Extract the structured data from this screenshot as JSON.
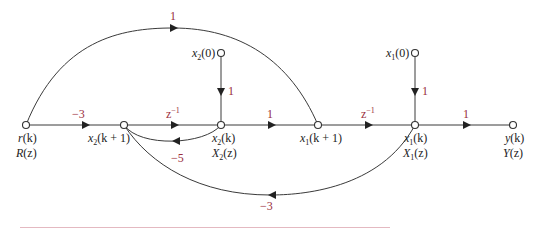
{
  "diagram": {
    "type": "signal-flow-graph",
    "colors": {
      "gain": "#9a2e3c",
      "line": "#3a3a3a",
      "rule": "#e4b9c1"
    },
    "nodes": [
      {
        "id": "r",
        "label_time": "r(k)",
        "label_z": "R(z)"
      },
      {
        "id": "x2k1",
        "label_time": "x2(k + 1)"
      },
      {
        "id": "x2k",
        "label_time": "x2(k)",
        "label_z": "X2(z)"
      },
      {
        "id": "x1k1",
        "label_time": "x1(k + 1)"
      },
      {
        "id": "x1k",
        "label_time": "x1(k)",
        "label_z": "X1(z)"
      },
      {
        "id": "y",
        "label_time": "y(k)",
        "label_z": "Y(z)"
      },
      {
        "id": "x20",
        "label_time": "x2(0)"
      },
      {
        "id": "x10",
        "label_time": "x1(0)"
      }
    ],
    "branches": [
      {
        "from": "r",
        "to": "x2k1",
        "gain": "−3"
      },
      {
        "from": "x2k1",
        "to": "x2k",
        "gain": "z",
        "gain_exp": "−1"
      },
      {
        "from": "x2k",
        "to": "x1k1",
        "gain": "1"
      },
      {
        "from": "x1k1",
        "to": "x1k",
        "gain": "z",
        "gain_exp": "−1"
      },
      {
        "from": "x1k",
        "to": "y",
        "gain": "1"
      },
      {
        "from": "x20",
        "to": "x2k",
        "gain": "1"
      },
      {
        "from": "x10",
        "to": "x1k",
        "gain": "1"
      },
      {
        "from": "r",
        "to": "x1k1",
        "gain": "1"
      },
      {
        "from": "x2k",
        "to": "x2k1",
        "gain": "−5"
      },
      {
        "from": "x1k",
        "to": "x2k1",
        "gain": "−3"
      }
    ]
  },
  "labels": {
    "r_time": "r",
    "r_time_arg": "(k)",
    "r_z": "R",
    "r_z_arg": "(z)",
    "x2k1_base": "x",
    "x2k1_sub": "2",
    "x2k1_arg": "(k + 1)",
    "x2k_base": "x",
    "x2k_sub": "2",
    "x2k_arg": "(k)",
    "X2z_base": "X",
    "X2z_sub": "2",
    "X2z_arg": "(z)",
    "x1k1_base": "x",
    "x1k1_sub": "1",
    "x1k1_arg": "(k + 1)",
    "x1k_base": "x",
    "x1k_sub": "1",
    "x1k_arg": "(k)",
    "X1z_base": "X",
    "X1z_sub": "1",
    "X1z_arg": "(z)",
    "y_time": "y",
    "y_time_arg": "(k)",
    "y_z": "Y",
    "y_z_arg": "(z)",
    "x20_base": "x",
    "x20_sub": "2",
    "x20_arg": "(0)",
    "x10_base": "x",
    "x10_sub": "1",
    "x10_arg": "(0)"
  },
  "gains": {
    "r_to_x2k1": "−3",
    "x2k1_to_x2k_base": "z",
    "x2k1_to_x2k_exp": "−1",
    "x2k_to_x1k1": "1",
    "x1k1_to_x1k_base": "z",
    "x1k1_to_x1k_exp": "−1",
    "x1k_to_y": "1",
    "x20_to_x2k": "1",
    "x10_to_x1k": "1",
    "r_to_x1k1": "1",
    "x2k_to_x2k1": "−5",
    "x1k_to_x2k1": "−3"
  }
}
